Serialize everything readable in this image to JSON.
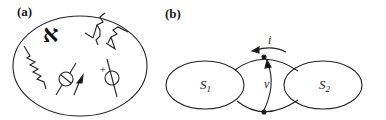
{
  "panel_a": {
    "label": "(a)",
    "symbols": [
      "aleph",
      "transformer-windings",
      "resistor",
      "current-source",
      "voltage-source"
    ],
    "aleph_glyph": "א",
    "voltage_source_plus": "+"
  },
  "panel_b": {
    "label": "(b)",
    "subsystem_1": "S",
    "subsystem_1_sub": "1",
    "subsystem_2": "S",
    "subsystem_2_sub": "2",
    "current_label": "i",
    "voltage_label": "v"
  },
  "colors": {
    "stroke": "#222222",
    "background": "#ffffff"
  }
}
